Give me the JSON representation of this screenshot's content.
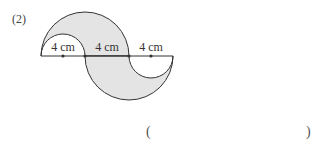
{
  "problem": {
    "number": "(2)",
    "segments": [
      {
        "label": "4 cm"
      },
      {
        "label": "4 cm"
      },
      {
        "label": "4 cm"
      }
    ],
    "answer": {
      "open": "(",
      "close": ")",
      "value": ""
    }
  },
  "colors": {
    "shade": "#e4e4e4",
    "stroke": "#333333"
  }
}
